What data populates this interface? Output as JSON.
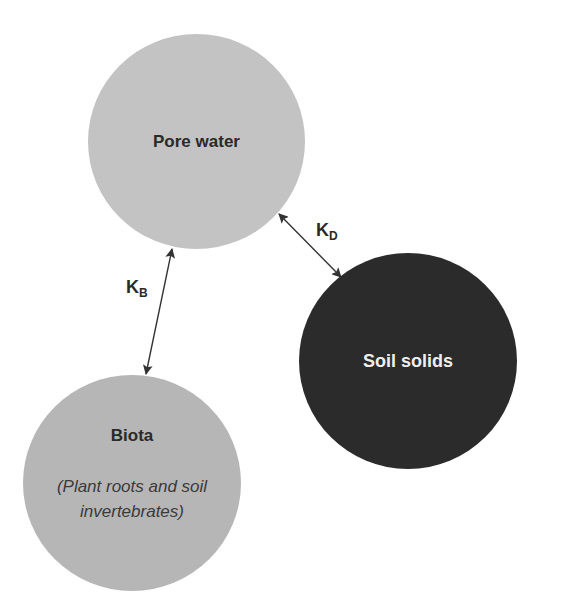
{
  "nodes": {
    "pore_water": {
      "label": "Pore water",
      "fill": "#c3c3c3",
      "text_color": "#2a2a2a"
    },
    "soil_solids": {
      "label": "Soil solids",
      "fill": "#2b2b2b",
      "text_color": "#eeeeee"
    },
    "biota": {
      "label": "Biota",
      "sub_line1": "(Plant roots and soil",
      "sub_line2": "invertebrates)",
      "fill": "#b6b6b6",
      "text_color": "#2a2a2a"
    }
  },
  "edges": {
    "kb": {
      "main": "K",
      "sub": "B",
      "from": "pore_water",
      "to": "biota",
      "direction": "bidirectional"
    },
    "kd": {
      "main": "K",
      "sub": "D",
      "from": "pore_water",
      "to": "soil_solids",
      "direction": "bidirectional"
    }
  },
  "colors": {
    "arrow": "#333333",
    "background": "#ffffff"
  }
}
